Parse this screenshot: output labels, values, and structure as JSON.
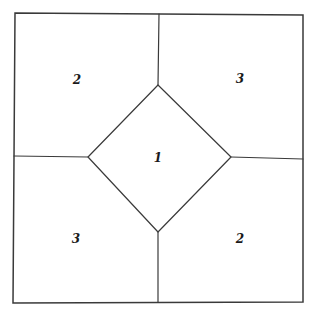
{
  "diagram": {
    "regions": [
      {
        "id": "top-left",
        "label": "2"
      },
      {
        "id": "top-right",
        "label": "3"
      },
      {
        "id": "center",
        "label": "1"
      },
      {
        "id": "bottom-left",
        "label": "3"
      },
      {
        "id": "bottom-right",
        "label": "2"
      }
    ],
    "line_color": "#3a3a3a",
    "label_color": "#1a1a1a",
    "background": "#ffffff"
  }
}
